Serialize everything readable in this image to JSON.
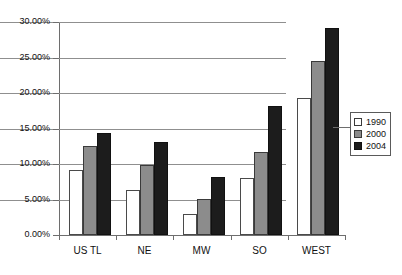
{
  "chart_data": {
    "type": "bar",
    "title": "",
    "subtitle": "",
    "xlabel": "",
    "ylabel": "",
    "categories": [
      "US TL",
      "NE",
      "MW",
      "SO",
      "WEST"
    ],
    "series": [
      {
        "name": "1990",
        "color": "#ffffff",
        "values": [
          9.1,
          6.4,
          3.0,
          8.0,
          19.3
        ]
      },
      {
        "name": "2000",
        "color": "#8c8c8c",
        "values": [
          12.5,
          9.9,
          5.0,
          11.7,
          24.5
        ]
      },
      {
        "name": "2004",
        "color": "#1c1c1c",
        "values": [
          14.3,
          13.1,
          8.1,
          18.1,
          29.1
        ]
      }
    ],
    "ylim": [
      0,
      30
    ],
    "ytick_values": [
      0,
      5,
      10,
      15,
      20,
      25,
      30
    ],
    "ytick_labels": [
      "0.00%",
      "5.00%",
      "10.00%",
      "15.00%",
      "20.00%",
      "25.00%",
      "30.00%"
    ],
    "grid": true,
    "grid_axis": "y",
    "legend_position": "right",
    "legend_entries": [
      "1990",
      "2000",
      "2004"
    ],
    "value_format": "percent"
  },
  "axes": {
    "y_labels": [
      "30.00%",
      "25.00%",
      "20.00%",
      "15.00%",
      "10.00%",
      "5.00%",
      "0.00%"
    ],
    "x_labels": [
      "US TL",
      "NE",
      "MW",
      "SO",
      "WEST"
    ]
  },
  "legend": {
    "items": [
      {
        "label": "1990",
        "swatch": "swatch-white"
      },
      {
        "label": "2000",
        "swatch": "swatch-gray"
      },
      {
        "label": "2004",
        "swatch": "swatch-black"
      }
    ]
  }
}
